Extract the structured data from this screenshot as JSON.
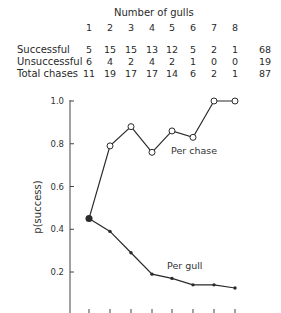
{
  "table": {
    "header": "Number of gulls",
    "columns": [
      "1",
      "2",
      "3",
      "4",
      "5",
      "6",
      "7",
      "8"
    ],
    "rows": [
      {
        "label": "Successful",
        "values": [
          "5",
          "15",
          "15",
          "13",
          "12",
          "5",
          "2",
          "1"
        ],
        "total": "68"
      },
      {
        "label": "Unsuccessful",
        "values": [
          "6",
          "4",
          "2",
          "4",
          "2",
          "1",
          "0",
          "0"
        ],
        "total": "19"
      },
      {
        "label": "Total chases",
        "values": [
          "11",
          "19",
          "17",
          "17",
          "14",
          "6",
          "2",
          "1"
        ],
        "total": "87"
      }
    ]
  },
  "chart_data": {
    "type": "line",
    "title": "",
    "xlabel": "Number of gulls",
    "ylabel": "p(success)",
    "x": [
      1,
      2,
      3,
      4,
      5,
      6,
      7,
      8
    ],
    "yticks": [
      "0.2",
      "0.4",
      "0.6",
      "0.8",
      "1.0"
    ],
    "ylim": [
      0,
      1.0
    ],
    "grid": false,
    "legend": "inline labels",
    "series": [
      {
        "name": "Per chase",
        "marker": "open-circle",
        "values": [
          0.45,
          0.79,
          0.88,
          0.76,
          0.86,
          0.83,
          1.0,
          1.0
        ]
      },
      {
        "name": "Per gull",
        "marker": "filled-dot",
        "values": [
          0.45,
          0.39,
          0.29,
          0.19,
          0.17,
          0.14,
          0.14,
          0.125
        ]
      }
    ]
  }
}
